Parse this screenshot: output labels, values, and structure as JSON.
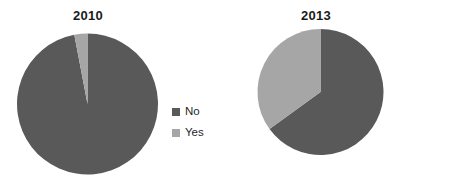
{
  "colors": {
    "no": "#595959",
    "yes": "#a6a6a6",
    "background": "#ffffff",
    "title_text": "#1a1a1a",
    "legend_text": "#1f1f1f"
  },
  "charts": [
    {
      "title": "2010",
      "legend": [
        {
          "label": "No",
          "color": "#595959"
        },
        {
          "label": "Yes",
          "color": "#a6a6a6"
        }
      ]
    },
    {
      "title": "2013",
      "legend": [
        {
          "label": "No",
          "color": "#595959"
        },
        {
          "label": "Yes",
          "color": "#a6a6a6"
        }
      ]
    }
  ],
  "chart_data": [
    {
      "type": "pie",
      "title": "2010",
      "categories": [
        "No",
        "Yes"
      ],
      "values": [
        97,
        3
      ],
      "unit": "percent",
      "colors": [
        "#595959",
        "#a6a6a6"
      ],
      "start_angle_deg": 0,
      "direction": "clockwise",
      "legend_position": "right",
      "labels_shown": false,
      "grid": false
    },
    {
      "type": "pie",
      "title": "2013",
      "categories": [
        "No",
        "Yes"
      ],
      "values": [
        65,
        35
      ],
      "unit": "percent",
      "colors": [
        "#595959",
        "#a6a6a6"
      ],
      "start_angle_deg": 0,
      "direction": "clockwise",
      "legend_position": "right",
      "labels_shown": false,
      "grid": false
    }
  ]
}
